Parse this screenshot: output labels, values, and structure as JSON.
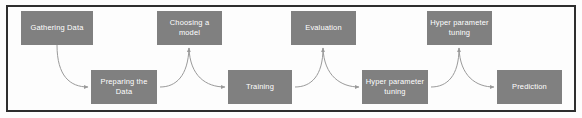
{
  "diagram": {
    "type": "flowchart",
    "background_color": "#fdfdfd",
    "border_color": "#2e2e2e",
    "node_fill_color": "#808080",
    "node_text_color": "#ffffff",
    "arrow_color": "#9a9a9a",
    "nodes": [
      {
        "id": "gathering-data",
        "label": "Gathering Data",
        "row": "top",
        "x": 21,
        "y": 11,
        "w": 72,
        "h": 34
      },
      {
        "id": "preparing-the-data",
        "label": "Preparing the\nData",
        "row": "bottom",
        "x": 91,
        "y": 70,
        "w": 66,
        "h": 34
      },
      {
        "id": "choosing-a-model",
        "label": "Choosing a\nmodel",
        "row": "top",
        "x": 157,
        "y": 11,
        "w": 65,
        "h": 34
      },
      {
        "id": "training",
        "label": "Training",
        "row": "bottom",
        "x": 228,
        "y": 70,
        "w": 64,
        "h": 34
      },
      {
        "id": "evaluation",
        "label": "Evaluation",
        "row": "top",
        "x": 291,
        "y": 11,
        "w": 65,
        "h": 34
      },
      {
        "id": "hyper-parameter-tuning-1",
        "label": "Hyper parameter\ntuning",
        "row": "bottom",
        "x": 362,
        "y": 70,
        "w": 66,
        "h": 34
      },
      {
        "id": "hyper-parameter-tuning-2",
        "label": "Hyper parameter\ntuning",
        "row": "top",
        "x": 427,
        "y": 11,
        "w": 65,
        "h": 34
      },
      {
        "id": "prediction",
        "label": "Prediction",
        "row": "bottom",
        "x": 497,
        "y": 70,
        "w": 65,
        "h": 34
      }
    ],
    "edges": [
      {
        "id": "edge-gathering-to-preparing",
        "from": "gathering-data",
        "to": "preparing-the-data",
        "path": "M 57 45 C 57 76, 70 87, 88 87"
      },
      {
        "id": "edge-preparing-to-choosing",
        "from": "preparing-the-data",
        "to": "choosing-a-model",
        "path": "M 160 87 C 176 87, 188 76, 189 48"
      },
      {
        "id": "edge-choosing-to-training",
        "from": "choosing-a-model",
        "to": "training",
        "path": "M 189 48 C 190 76, 206 87, 225 87"
      },
      {
        "id": "edge-training-to-evaluation",
        "from": "training",
        "to": "evaluation",
        "path": "M 295 87 C 311 87, 323 76, 323 48"
      },
      {
        "id": "edge-evaluation-to-tuning1",
        "from": "evaluation",
        "to": "hyper-parameter-tuning-1",
        "path": "M 323 48 C 324 76, 341 87, 359 87"
      },
      {
        "id": "edge-tuning1-to-tuning2",
        "from": "hyper-parameter-tuning-1",
        "to": "hyper-parameter-tuning-2",
        "path": "M 431 87 C 447 87, 459 76, 459 48"
      },
      {
        "id": "edge-tuning2-to-prediction",
        "from": "hyper-parameter-tuning-2",
        "to": "prediction",
        "path": "M 459 48 C 460 76, 476 87, 494 87"
      }
    ]
  }
}
